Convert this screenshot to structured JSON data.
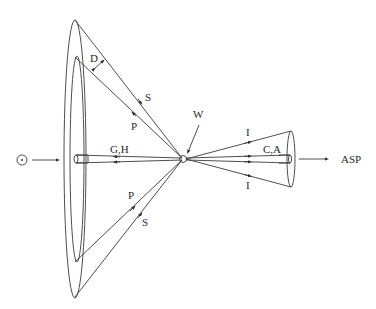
{
  "labels": {
    "d": "D",
    "s_top": "S",
    "p_top": "P",
    "w": "W",
    "i_top": "I",
    "i_bottom": "I",
    "ca": "C,A",
    "gh": "G,H",
    "asp": "ASP",
    "p_bottom": "P",
    "s_bottom": "S"
  },
  "symbols": {
    "sun": "⊙"
  },
  "colors": {
    "line": "#3a3a3a",
    "text": "#2a2a2a",
    "background": "#ffffff"
  }
}
